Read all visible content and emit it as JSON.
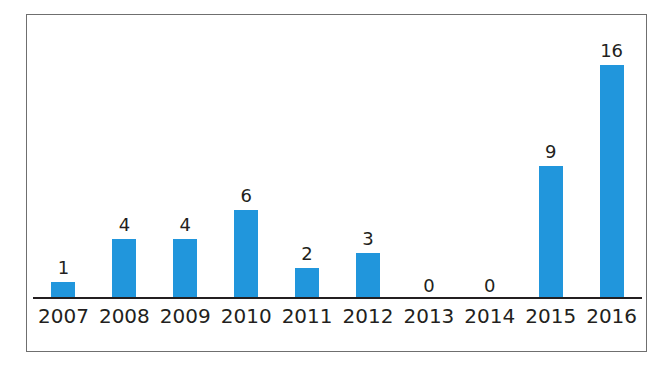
{
  "figure": {
    "frame_border_color": "#6f6f6f",
    "background_color": "#ffffff",
    "axis_color": "#221f20"
  },
  "chart_data": {
    "type": "bar",
    "title": "",
    "subtitle": "",
    "xlabel": "",
    "ylabel": "",
    "categories": [
      "2007",
      "2008",
      "2009",
      "2010",
      "2011",
      "2012",
      "2013",
      "2014",
      "2015",
      "2016"
    ],
    "values": [
      1,
      4,
      4,
      6,
      2,
      3,
      0,
      0,
      9,
      16
    ],
    "data_labels": [
      "1",
      "4",
      "4",
      "6",
      "2",
      "3",
      "0",
      "0",
      "9",
      "16"
    ],
    "series": [
      {
        "name": "",
        "color": "#2196DC",
        "values": [
          1,
          4,
          4,
          6,
          2,
          3,
          0,
          0,
          9,
          16
        ]
      }
    ],
    "ylim": [
      0,
      19
    ],
    "grid": false,
    "legend": false,
    "legend_position": "none",
    "annotations": [],
    "bar_color": "#2196DC",
    "label_color": "#231f20",
    "tick_label_color": "#231f20"
  }
}
